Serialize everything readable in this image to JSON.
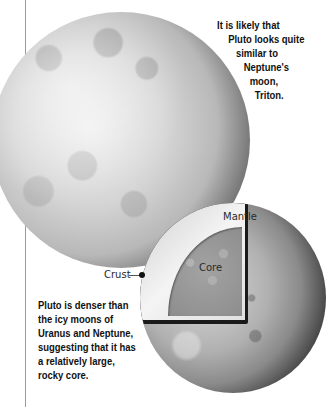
{
  "captions": {
    "triton_comparison": {
      "lines": [
        "It is likely that",
        "Pluto looks quite",
        "similar to",
        "Neptune's",
        "moon,",
        "Triton."
      ]
    },
    "density": {
      "lines": [
        "Pluto is denser than",
        "the icy moons of",
        "Uranus and Neptune,",
        "suggesting that it has",
        "a relatively large,",
        "rocky core."
      ]
    }
  },
  "diagram_labels": {
    "mantle": "Mantle",
    "core": "Core",
    "crust": "Crust"
  },
  "images": {
    "pluto_surface": "pluto-globe",
    "pluto_cutaway": "pluto-cutaway"
  }
}
